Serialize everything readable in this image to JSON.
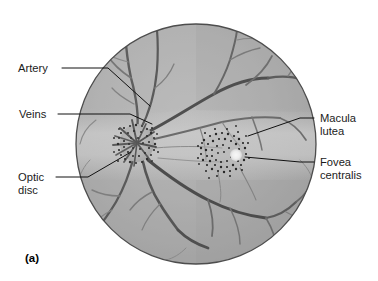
{
  "figure": {
    "panel_label": "(a)",
    "style": "grayscale medical line illustration"
  },
  "labels": {
    "artery": "Artery",
    "veins": "Veins",
    "optic_disc_line1": "Optic",
    "optic_disc_line2": "disc",
    "macula_line1": "Macula",
    "macula_line2": "lutea",
    "fovea_line1": "Fovea",
    "fovea_line2": "centralis"
  },
  "colors": {
    "retina_base": "#a9a9a9",
    "retina_light": "#c4c4c4",
    "retina_dark": "#8e8e8e",
    "vessel_dark": "#4a4a4a",
    "vessel_mid": "#6d6d6d",
    "vessel_light": "#8a8a8a",
    "stipple": "#2b2b2b",
    "fovea_spot": "#f2f2f2",
    "outline": "#555555",
    "text": "#1b1b1b",
    "leader": "#111111",
    "background": "#ffffff"
  },
  "geometry": {
    "circle_center_x": 196,
    "circle_center_y": 144,
    "circle_radius": 120,
    "optic_disc_x": 137,
    "optic_disc_y": 143,
    "optic_disc_r": 17,
    "macula_x": 223,
    "macula_y": 152,
    "macula_r": 22,
    "fovea_x": 236,
    "fovea_y": 155,
    "fovea_r": 6
  },
  "anatomy_parts": [
    {
      "name": "Artery",
      "side": "left",
      "description": "retinal artery branch entering upper-left of optic disc"
    },
    {
      "name": "Veins",
      "side": "left",
      "description": "retinal veins radiating from optic disc"
    },
    {
      "name": "Optic disc",
      "side": "left",
      "description": "blind spot where optic nerve and vessels exit"
    },
    {
      "name": "Macula lutea",
      "side": "right",
      "description": "pigmented yellow spot lateral to optic disc"
    },
    {
      "name": "Fovea centralis",
      "side": "right",
      "description": "central depression of the macula, area of sharpest vision"
    }
  ]
}
